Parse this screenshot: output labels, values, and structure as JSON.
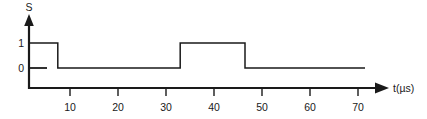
{
  "figure": {
    "title": "",
    "y_axis_name": "S",
    "x_axis_name": "t(µs)",
    "level_labels": [
      "1",
      "0"
    ],
    "level_high_label": "1",
    "level_low_label": "0",
    "stroke_color": "#1a1a1a",
    "background_color": "#ffffff"
  },
  "chart_data": {
    "type": "line",
    "title": "",
    "xlabel": "t(µs)",
    "ylabel": "S",
    "xlim": [
      0,
      74.8
    ],
    "ylim": [
      0,
      1
    ],
    "grid": false,
    "legend": null,
    "x_ticks": [
      10,
      20,
      30,
      40,
      50,
      60,
      70
    ],
    "x_tick_labels": [
      "10",
      "20",
      "30",
      "40",
      "50",
      "60",
      "70"
    ],
    "y_ticks": [
      0,
      1
    ],
    "y_tick_labels": [
      "0",
      "1"
    ],
    "series": [
      {
        "name": "S",
        "style": "digital-step",
        "x": [
          0,
          6.0,
          6.0,
          31.5,
          31.5,
          45.0,
          45.0,
          70.0
        ],
        "values": [
          1,
          1,
          0,
          0,
          1,
          1,
          0,
          0
        ],
        "transitions": [
          {
            "time": 6.0,
            "edge": "falling",
            "from": 1,
            "to": 0
          },
          {
            "time": 31.5,
            "edge": "rising",
            "from": 0,
            "to": 1
          },
          {
            "time": 45.0,
            "edge": "falling",
            "from": 1,
            "to": 0
          }
        ],
        "pulses": [
          {
            "start": 0,
            "end": 6.0,
            "level": 1
          },
          {
            "start": 31.5,
            "end": 45.0,
            "level": 1
          }
        ]
      }
    ]
  }
}
